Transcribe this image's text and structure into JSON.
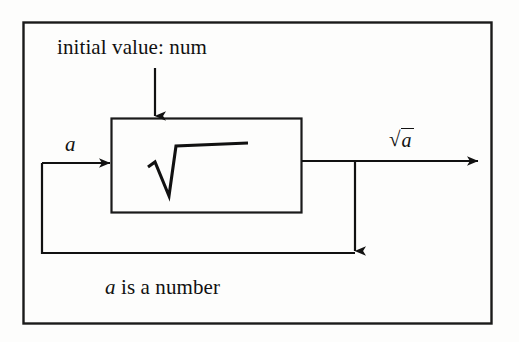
{
  "figure": {
    "type": "block-diagram",
    "background_color": "#fdfdfc",
    "stroke_color": "#111111",
    "labels": {
      "initial_value": "initial value: num",
      "input_variable": "a",
      "output_radical_glyph": "√",
      "output_radicand": "a",
      "output_full": "√a",
      "caption_variable": "a",
      "caption_rest": "is a number",
      "caption_full": "a is a number",
      "block_operation_glyph": "√"
    },
    "nodes": [
      {
        "name": "sqrt-block",
        "label": "√",
        "x": 111,
        "y": 118,
        "width": 191,
        "height": 95
      }
    ],
    "edges": [
      {
        "name": "initial-value-edge",
        "from": "initial value: num",
        "to": "sqrt-block",
        "direction": "down",
        "arrowhead": true
      },
      {
        "name": "input-edge",
        "from": "feedback",
        "to": "sqrt-block",
        "label": "a",
        "direction": "right",
        "arrowhead": true
      },
      {
        "name": "output-edge",
        "from": "sqrt-block",
        "to": "output",
        "label": "√a",
        "direction": "right",
        "arrowhead": true
      },
      {
        "name": "feedback-edge",
        "from": "output junction",
        "to": "input-edge",
        "direction": "down-then-left",
        "arrowhead": true
      }
    ]
  }
}
